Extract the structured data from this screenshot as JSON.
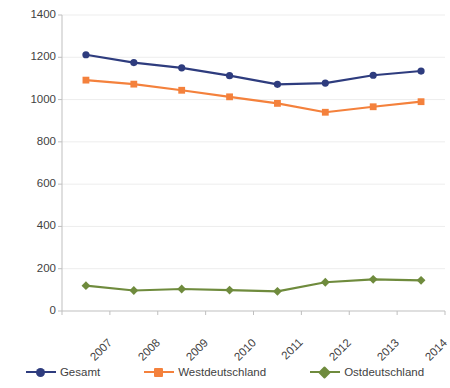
{
  "chart_data": {
    "type": "line",
    "title": "",
    "subtitle": "",
    "xlabel": "",
    "ylabel": "",
    "categories": [
      "2007",
      "2008",
      "2009",
      "2010",
      "2011",
      "2012",
      "2013",
      "2014"
    ],
    "series": [
      {
        "name": "Gesamt",
        "color": "#2E3C7E",
        "marker": "circle",
        "values": [
          1212,
          1175,
          1150,
          1113,
          1072,
          1078,
          1115,
          1135
        ]
      },
      {
        "name": "Westdeutschland",
        "color": "#F4813C",
        "marker": "square",
        "values": [
          1092,
          1073,
          1044,
          1013,
          982,
          940,
          966,
          990
        ]
      },
      {
        "name": "Ostdeutschland",
        "color": "#6F8B3D",
        "marker": "diamond",
        "values": [
          120,
          97,
          104,
          99,
          93,
          136,
          150,
          145
        ]
      }
    ],
    "ylim": [
      0,
      1400
    ],
    "ytick_values": [
      0,
      200,
      400,
      600,
      800,
      1000,
      1200,
      1400
    ],
    "ytick_labels": [
      "0",
      "200",
      "400",
      "600",
      "800",
      "1000",
      "1200",
      "1400"
    ],
    "grid": "y-gridlines-light",
    "legend_position": "bottom",
    "axis_color": "#BFBFBF",
    "tick_label_color": "#3F3F3F",
    "xtick_rotation": -45
  }
}
